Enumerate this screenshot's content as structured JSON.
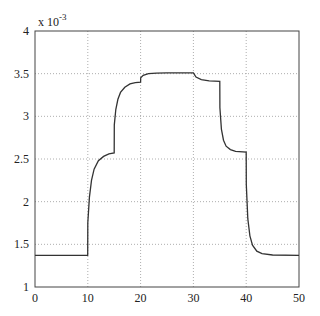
{
  "chart_data": {
    "type": "line",
    "title": "",
    "xlabel": "",
    "ylabel": "",
    "y_multiplier": "x 10^-3",
    "y_multiplier_base": "x 10",
    "y_multiplier_exp": "-3",
    "xlim": [
      0,
      50
    ],
    "ylim": [
      1,
      4
    ],
    "grid": true,
    "x_ticks": [
      "0",
      "10",
      "20",
      "30",
      "40",
      "50"
    ],
    "y_ticks": [
      "1",
      "1.5",
      "2",
      "2.5",
      "3",
      "3.5",
      "4"
    ],
    "series": [
      {
        "name": "response",
        "color": "#333333",
        "x": [
          0,
          9.99,
          10,
          10.3,
          10.7,
          11.2,
          12,
          13,
          14,
          15,
          15.01,
          15.3,
          15.7,
          16.2,
          17,
          18,
          19,
          20,
          20.01,
          20.5,
          21.5,
          23,
          25,
          30,
          30.5,
          31.5,
          33,
          35,
          35.01,
          35.3,
          35.7,
          36.2,
          37,
          38,
          40,
          40.01,
          40.3,
          40.7,
          41.2,
          42,
          43,
          45,
          50
        ],
        "values": [
          1.37,
          1.37,
          1.75,
          2.05,
          2.25,
          2.38,
          2.48,
          2.53,
          2.56,
          2.57,
          2.9,
          3.08,
          3.2,
          3.28,
          3.34,
          3.38,
          3.395,
          3.4,
          3.45,
          3.48,
          3.5,
          3.505,
          3.51,
          3.51,
          3.46,
          3.43,
          3.415,
          3.41,
          3.1,
          2.85,
          2.72,
          2.65,
          2.61,
          2.59,
          2.58,
          2.2,
          1.8,
          1.6,
          1.49,
          1.42,
          1.39,
          1.375,
          1.37
        ]
      }
    ]
  }
}
